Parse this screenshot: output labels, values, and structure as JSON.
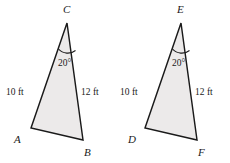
{
  "figure": {
    "name": "two-congruent-triangles",
    "background_color": "#ffffff",
    "fill_color": "#eceaea",
    "stroke_color": "#1a1a1a",
    "triangles": [
      {
        "id": "left",
        "apex_label": "C",
        "bottom_left_label": "A",
        "bottom_right_label": "B",
        "left_side_length": "10 ft",
        "right_side_length": "12 ft",
        "apex_angle": "20°"
      },
      {
        "id": "right",
        "apex_label": "E",
        "bottom_left_label": "D",
        "bottom_right_label": "F",
        "left_side_length": "10 ft",
        "right_side_length": "12 ft",
        "apex_angle": "20°"
      }
    ]
  }
}
